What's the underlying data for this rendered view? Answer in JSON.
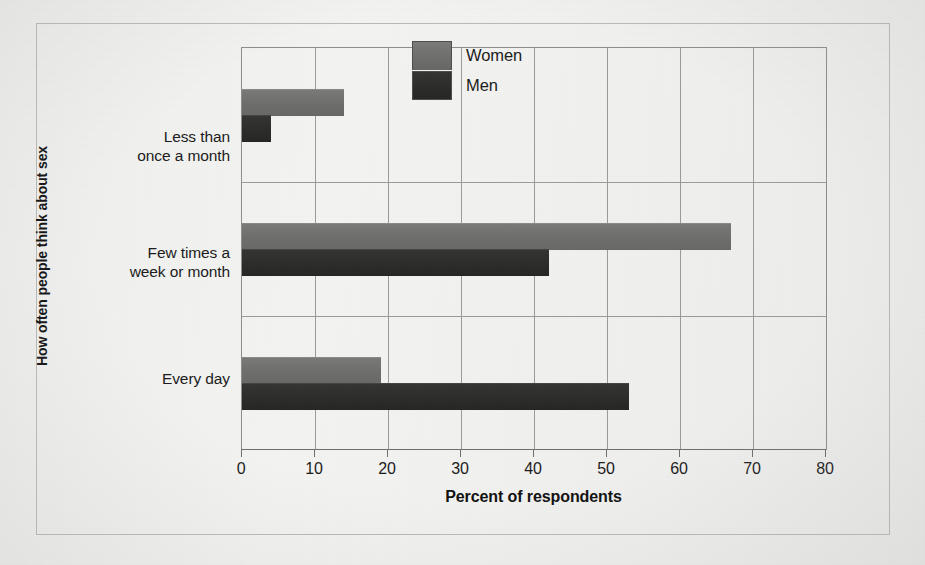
{
  "chart_data": {
    "type": "bar",
    "orientation": "horizontal",
    "title": "",
    "xlabel": "Percent of respondents",
    "ylabel": "How often people think about sex",
    "categories": [
      "Less than once a month",
      "Few times a week or month",
      "Every day"
    ],
    "category_lines": [
      [
        "Less than",
        "once a month"
      ],
      [
        "Few times a",
        "week or month"
      ],
      [
        "Every day"
      ]
    ],
    "series": [
      {
        "name": "Women",
        "color": "#6d6d6b",
        "values": [
          14,
          67,
          19
        ]
      },
      {
        "name": "Men",
        "color": "#2b2b29",
        "values": [
          4,
          42,
          53
        ]
      }
    ],
    "xlim": [
      0,
      80
    ],
    "xticks": [
      0,
      10,
      20,
      30,
      40,
      50,
      60,
      70,
      80
    ],
    "xtick_labels": [
      "0",
      "10",
      "20",
      "30",
      "40",
      "50",
      "60",
      "70",
      "80"
    ],
    "grid": "vertical",
    "legend_position": "top-right-inside",
    "legend_entries": [
      "Women",
      "Men"
    ]
  },
  "legend": {
    "women_label": "Women",
    "men_label": "Men"
  },
  "axis": {
    "x_title": "Percent of respondents",
    "y_title": "How often people think about sex"
  },
  "colors": {
    "women": "#6d6d6b",
    "men": "#2b2b29",
    "paper": "#f1f1ef",
    "grid": "#9a9a98",
    "text": "#1b1b1b"
  }
}
